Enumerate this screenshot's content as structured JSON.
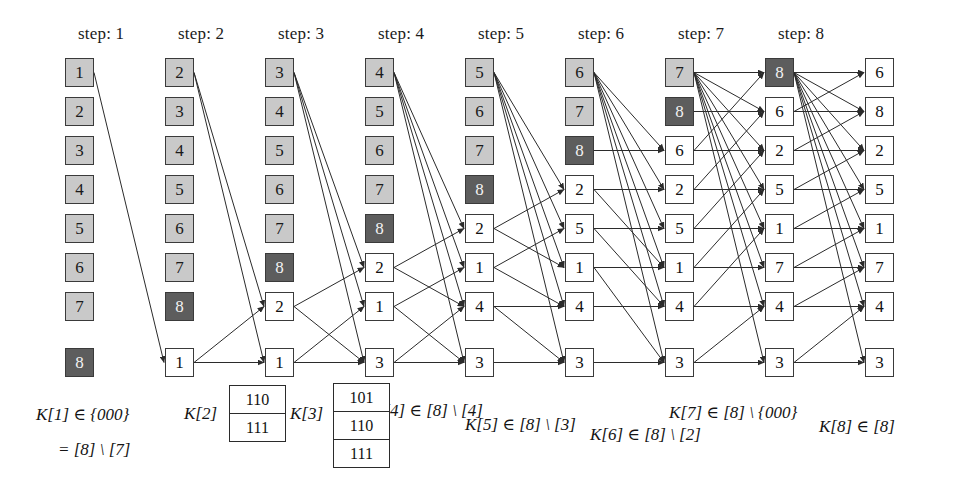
{
  "figure": {
    "background_color": "#ffffff",
    "colors": {
      "node_uninformed": "#c9c9c9",
      "node_source": "#5d5d5d",
      "node_informed": "#ffffff",
      "stroke": "#3a3a3a",
      "edge": "#2b2b2b",
      "text": "#111111"
    }
  },
  "step_labels": [
    {
      "text": "step: 1",
      "x": 78,
      "y": 24
    },
    {
      "text": "step: 2",
      "x": 178,
      "y": 24
    },
    {
      "text": "step: 3",
      "x": 278,
      "y": 24
    },
    {
      "text": "step: 4",
      "x": 378,
      "y": 24
    },
    {
      "text": "step: 5",
      "x": 478,
      "y": 24
    },
    {
      "text": "step: 6",
      "x": 578,
      "y": 24
    },
    {
      "text": "step: 7",
      "x": 678,
      "y": 24
    },
    {
      "text": "step: 8",
      "x": 778,
      "y": 24
    }
  ],
  "columns": [
    {
      "name": "column-0",
      "x": 65,
      "nodes": [
        {
          "label": "1",
          "state": "gray"
        },
        {
          "label": "2",
          "state": "gray"
        },
        {
          "label": "3",
          "state": "gray"
        },
        {
          "label": "4",
          "state": "gray"
        },
        {
          "label": "5",
          "state": "gray"
        },
        {
          "label": "6",
          "state": "gray"
        },
        {
          "label": "7",
          "state": "gray"
        },
        {
          "label": "8",
          "state": "dark"
        }
      ]
    },
    {
      "name": "column-1",
      "x": 165,
      "nodes": [
        {
          "label": "2",
          "state": "gray"
        },
        {
          "label": "3",
          "state": "gray"
        },
        {
          "label": "4",
          "state": "gray"
        },
        {
          "label": "5",
          "state": "gray"
        },
        {
          "label": "6",
          "state": "gray"
        },
        {
          "label": "7",
          "state": "gray"
        },
        {
          "label": "8",
          "state": "dark"
        },
        {
          "label": "1",
          "state": "plain"
        }
      ]
    },
    {
      "name": "column-2",
      "x": 265,
      "nodes": [
        {
          "label": "3",
          "state": "gray"
        },
        {
          "label": "4",
          "state": "gray"
        },
        {
          "label": "5",
          "state": "gray"
        },
        {
          "label": "6",
          "state": "gray"
        },
        {
          "label": "7",
          "state": "gray"
        },
        {
          "label": "8",
          "state": "dark"
        },
        {
          "label": "2",
          "state": "plain"
        },
        {
          "label": "1",
          "state": "plain"
        }
      ]
    },
    {
      "name": "column-3",
      "x": 365,
      "nodes": [
        {
          "label": "4",
          "state": "gray"
        },
        {
          "label": "5",
          "state": "gray"
        },
        {
          "label": "6",
          "state": "gray"
        },
        {
          "label": "7",
          "state": "gray"
        },
        {
          "label": "8",
          "state": "dark"
        },
        {
          "label": "2",
          "state": "plain"
        },
        {
          "label": "1",
          "state": "plain"
        },
        {
          "label": "3",
          "state": "plain"
        }
      ]
    },
    {
      "name": "column-4",
      "x": 465,
      "nodes": [
        {
          "label": "5",
          "state": "gray"
        },
        {
          "label": "6",
          "state": "gray"
        },
        {
          "label": "7",
          "state": "gray"
        },
        {
          "label": "8",
          "state": "dark"
        },
        {
          "label": "2",
          "state": "plain"
        },
        {
          "label": "1",
          "state": "plain"
        },
        {
          "label": "4",
          "state": "plain"
        },
        {
          "label": "3",
          "state": "plain"
        }
      ]
    },
    {
      "name": "column-5",
      "x": 565,
      "nodes": [
        {
          "label": "6",
          "state": "gray"
        },
        {
          "label": "7",
          "state": "gray"
        },
        {
          "label": "8",
          "state": "dark"
        },
        {
          "label": "2",
          "state": "plain"
        },
        {
          "label": "5",
          "state": "plain"
        },
        {
          "label": "1",
          "state": "plain"
        },
        {
          "label": "4",
          "state": "plain"
        },
        {
          "label": "3",
          "state": "plain"
        }
      ]
    },
    {
      "name": "column-6",
      "x": 665,
      "nodes": [
        {
          "label": "7",
          "state": "gray"
        },
        {
          "label": "8",
          "state": "dark"
        },
        {
          "label": "6",
          "state": "plain"
        },
        {
          "label": "2",
          "state": "plain"
        },
        {
          "label": "5",
          "state": "plain"
        },
        {
          "label": "1",
          "state": "plain"
        },
        {
          "label": "4",
          "state": "plain"
        },
        {
          "label": "3",
          "state": "plain"
        }
      ]
    },
    {
      "name": "column-7",
      "x": 765,
      "nodes": [
        {
          "label": "8",
          "state": "dark"
        },
        {
          "label": "6",
          "state": "plain"
        },
        {
          "label": "2",
          "state": "plain"
        },
        {
          "label": "5",
          "state": "plain"
        },
        {
          "label": "1",
          "state": "plain"
        },
        {
          "label": "7",
          "state": "plain"
        },
        {
          "label": "4",
          "state": "plain"
        },
        {
          "label": "3",
          "state": "plain"
        }
      ]
    },
    {
      "name": "column-8",
      "x": 865,
      "nodes": [
        {
          "label": "6",
          "state": "plain"
        },
        {
          "label": "8",
          "state": "plain"
        },
        {
          "label": "2",
          "state": "plain"
        },
        {
          "label": "5",
          "state": "plain"
        },
        {
          "label": "1",
          "state": "plain"
        },
        {
          "label": "7",
          "state": "plain"
        },
        {
          "label": "4",
          "state": "plain"
        },
        {
          "label": "3",
          "state": "plain"
        }
      ]
    }
  ],
  "layout": {
    "node_size": 29,
    "row_y": [
      58,
      97,
      136,
      175,
      214,
      253,
      292,
      348
    ],
    "row_spacing": 39
  },
  "formulas": [
    {
      "name": "formula-k1",
      "text": "K[1] ∈ {000}",
      "x": 36,
      "y": 404
    },
    {
      "name": "formula-k1-cont",
      "text": "= [8] \\ [7]",
      "x": 58,
      "y": 440
    },
    {
      "name": "formula-k2",
      "text": "K[2]",
      "x": 184,
      "y": 404
    },
    {
      "name": "formula-k3",
      "text": "K[3]",
      "x": 290,
      "y": 404
    },
    {
      "name": "formula-k4",
      "text": "K[4] ∈ [8] \\ [4]",
      "x": 372,
      "y": 400
    },
    {
      "name": "formula-k5",
      "text": "K[5] ∈ [8] \\ [3]",
      "x": 465,
      "y": 414
    },
    {
      "name": "formula-k6",
      "text": "K[6] ∈ [8] \\ [2]",
      "x": 590,
      "y": 424
    },
    {
      "name": "formula-k7",
      "text": "K[7] ∈ [8] \\ {000}",
      "x": 669,
      "y": 402
    },
    {
      "name": "formula-k8",
      "text": "K[8] ∈ [8]",
      "x": 819,
      "y": 416
    }
  ],
  "key_boxes": [
    {
      "name": "keybox-k2",
      "x": 229,
      "y": 385,
      "width": 57,
      "rows": [
        "110",
        "111"
      ]
    },
    {
      "name": "keybox-k3",
      "x": 333,
      "y": 383,
      "width": 57,
      "rows": [
        "101",
        "110",
        "111"
      ]
    }
  ],
  "edges": [
    {
      "from": [
        0,
        0
      ],
      "to": [
        1,
        7
      ]
    },
    {
      "from": [
        1,
        0
      ],
      "to": [
        2,
        6
      ]
    },
    {
      "from": [
        1,
        0
      ],
      "to": [
        2,
        7
      ]
    },
    {
      "from": [
        1,
        7
      ],
      "to": [
        2,
        7
      ]
    },
    {
      "from": [
        1,
        7
      ],
      "to": [
        2,
        6
      ]
    },
    {
      "from": [
        2,
        0
      ],
      "to": [
        3,
        5
      ]
    },
    {
      "from": [
        2,
        0
      ],
      "to": [
        3,
        6
      ]
    },
    {
      "from": [
        2,
        0
      ],
      "to": [
        3,
        7
      ]
    },
    {
      "from": [
        2,
        6
      ],
      "to": [
        3,
        5
      ]
    },
    {
      "from": [
        2,
        6
      ],
      "to": [
        3,
        7
      ]
    },
    {
      "from": [
        2,
        7
      ],
      "to": [
        3,
        6
      ]
    },
    {
      "from": [
        2,
        7
      ],
      "to": [
        3,
        7
      ]
    },
    {
      "from": [
        3,
        0
      ],
      "to": [
        4,
        4
      ]
    },
    {
      "from": [
        3,
        0
      ],
      "to": [
        4,
        5
      ]
    },
    {
      "from": [
        3,
        0
      ],
      "to": [
        4,
        6
      ]
    },
    {
      "from": [
        3,
        0
      ],
      "to": [
        4,
        7
      ]
    },
    {
      "from": [
        3,
        5
      ],
      "to": [
        4,
        4
      ]
    },
    {
      "from": [
        3,
        5
      ],
      "to": [
        4,
        6
      ]
    },
    {
      "from": [
        3,
        6
      ],
      "to": [
        4,
        5
      ]
    },
    {
      "from": [
        3,
        6
      ],
      "to": [
        4,
        7
      ]
    },
    {
      "from": [
        3,
        7
      ],
      "to": [
        4,
        7
      ]
    },
    {
      "from": [
        3,
        7
      ],
      "to": [
        4,
        6
      ]
    },
    {
      "from": [
        4,
        0
      ],
      "to": [
        5,
        3
      ]
    },
    {
      "from": [
        4,
        0
      ],
      "to": [
        5,
        4
      ]
    },
    {
      "from": [
        4,
        0
      ],
      "to": [
        5,
        5
      ]
    },
    {
      "from": [
        4,
        0
      ],
      "to": [
        5,
        6
      ]
    },
    {
      "from": [
        4,
        0
      ],
      "to": [
        5,
        7
      ]
    },
    {
      "from": [
        4,
        4
      ],
      "to": [
        5,
        3
      ]
    },
    {
      "from": [
        4,
        4
      ],
      "to": [
        5,
        5
      ]
    },
    {
      "from": [
        4,
        5
      ],
      "to": [
        5,
        4
      ]
    },
    {
      "from": [
        4,
        5
      ],
      "to": [
        5,
        6
      ]
    },
    {
      "from": [
        4,
        6
      ],
      "to": [
        5,
        6
      ]
    },
    {
      "from": [
        4,
        6
      ],
      "to": [
        5,
        7
      ]
    },
    {
      "from": [
        4,
        7
      ],
      "to": [
        5,
        7
      ]
    },
    {
      "from": [
        5,
        0
      ],
      "to": [
        6,
        2
      ]
    },
    {
      "from": [
        5,
        0
      ],
      "to": [
        6,
        3
      ]
    },
    {
      "from": [
        5,
        0
      ],
      "to": [
        6,
        4
      ]
    },
    {
      "from": [
        5,
        0
      ],
      "to": [
        6,
        5
      ]
    },
    {
      "from": [
        5,
        0
      ],
      "to": [
        6,
        6
      ]
    },
    {
      "from": [
        5,
        0
      ],
      "to": [
        6,
        7
      ]
    },
    {
      "from": [
        5,
        2
      ],
      "to": [
        6,
        2
      ]
    },
    {
      "from": [
        5,
        3
      ],
      "to": [
        6,
        3
      ]
    },
    {
      "from": [
        5,
        4
      ],
      "to": [
        6,
        4
      ]
    },
    {
      "from": [
        5,
        5
      ],
      "to": [
        6,
        5
      ]
    },
    {
      "from": [
        5,
        6
      ],
      "to": [
        6,
        6
      ]
    },
    {
      "from": [
        5,
        7
      ],
      "to": [
        6,
        7
      ]
    },
    {
      "from": [
        5,
        3
      ],
      "to": [
        6,
        5
      ]
    },
    {
      "from": [
        5,
        4
      ],
      "to": [
        6,
        6
      ]
    },
    {
      "from": [
        5,
        5
      ],
      "to": [
        6,
        7
      ]
    },
    {
      "from": [
        6,
        0
      ],
      "to": [
        7,
        0
      ]
    },
    {
      "from": [
        6,
        0
      ],
      "to": [
        7,
        1
      ]
    },
    {
      "from": [
        6,
        0
      ],
      "to": [
        7,
        2
      ]
    },
    {
      "from": [
        6,
        0
      ],
      "to": [
        7,
        3
      ]
    },
    {
      "from": [
        6,
        0
      ],
      "to": [
        7,
        4
      ]
    },
    {
      "from": [
        6,
        0
      ],
      "to": [
        7,
        5
      ]
    },
    {
      "from": [
        6,
        0
      ],
      "to": [
        7,
        6
      ]
    },
    {
      "from": [
        6,
        0
      ],
      "to": [
        7,
        7
      ]
    },
    {
      "from": [
        6,
        1
      ],
      "to": [
        7,
        1
      ]
    },
    {
      "from": [
        6,
        2
      ],
      "to": [
        7,
        2
      ]
    },
    {
      "from": [
        6,
        3
      ],
      "to": [
        7,
        3
      ]
    },
    {
      "from": [
        6,
        4
      ],
      "to": [
        7,
        4
      ]
    },
    {
      "from": [
        6,
        5
      ],
      "to": [
        7,
        5
      ]
    },
    {
      "from": [
        6,
        6
      ],
      "to": [
        7,
        6
      ]
    },
    {
      "from": [
        6,
        7
      ],
      "to": [
        7,
        7
      ]
    },
    {
      "from": [
        6,
        2
      ],
      "to": [
        7,
        0
      ]
    },
    {
      "from": [
        6,
        3
      ],
      "to": [
        7,
        1
      ]
    },
    {
      "from": [
        6,
        4
      ],
      "to": [
        7,
        2
      ]
    },
    {
      "from": [
        6,
        5
      ],
      "to": [
        7,
        3
      ]
    },
    {
      "from": [
        6,
        6
      ],
      "to": [
        7,
        4
      ]
    },
    {
      "from": [
        6,
        7
      ],
      "to": [
        7,
        6
      ]
    },
    {
      "from": [
        7,
        0
      ],
      "to": [
        8,
        0
      ]
    },
    {
      "from": [
        7,
        0
      ],
      "to": [
        8,
        1
      ]
    },
    {
      "from": [
        7,
        0
      ],
      "to": [
        8,
        2
      ]
    },
    {
      "from": [
        7,
        0
      ],
      "to": [
        8,
        3
      ]
    },
    {
      "from": [
        7,
        0
      ],
      "to": [
        8,
        4
      ]
    },
    {
      "from": [
        7,
        0
      ],
      "to": [
        8,
        5
      ]
    },
    {
      "from": [
        7,
        0
      ],
      "to": [
        8,
        6
      ]
    },
    {
      "from": [
        7,
        0
      ],
      "to": [
        8,
        7
      ]
    },
    {
      "from": [
        7,
        1
      ],
      "to": [
        8,
        0
      ]
    },
    {
      "from": [
        7,
        1
      ],
      "to": [
        8,
        1
      ]
    },
    {
      "from": [
        7,
        2
      ],
      "to": [
        8,
        2
      ]
    },
    {
      "from": [
        7,
        3
      ],
      "to": [
        8,
        3
      ]
    },
    {
      "from": [
        7,
        4
      ],
      "to": [
        8,
        4
      ]
    },
    {
      "from": [
        7,
        5
      ],
      "to": [
        8,
        5
      ]
    },
    {
      "from": [
        7,
        6
      ],
      "to": [
        8,
        6
      ]
    },
    {
      "from": [
        7,
        7
      ],
      "to": [
        8,
        7
      ]
    },
    {
      "from": [
        7,
        2
      ],
      "to": [
        8,
        1
      ]
    },
    {
      "from": [
        7,
        3
      ],
      "to": [
        8,
        2
      ]
    },
    {
      "from": [
        7,
        4
      ],
      "to": [
        8,
        3
      ]
    },
    {
      "from": [
        7,
        5
      ],
      "to": [
        8,
        4
      ]
    },
    {
      "from": [
        7,
        6
      ],
      "to": [
        8,
        5
      ]
    },
    {
      "from": [
        7,
        7
      ],
      "to": [
        8,
        6
      ]
    }
  ]
}
